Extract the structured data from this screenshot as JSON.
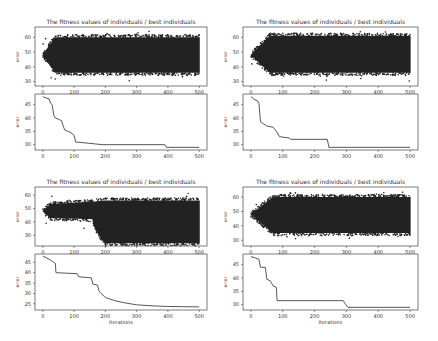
{
  "chart_data": [
    {
      "id": "top-left",
      "panel": {
        "x": 0,
        "y": 0
      },
      "scatter": {
        "type": "scatter",
        "title": "The fitness values of individuals / best individuals",
        "xlabel": "",
        "ylabel": "error",
        "xlim": [
          -25,
          525
        ],
        "ylim": [
          27,
          67
        ],
        "xticks": [
          0,
          100,
          200,
          300,
          400,
          500
        ],
        "yticks": [
          30,
          40,
          50,
          60
        ],
        "envelope": {
          "start": 48,
          "ramp_end": 40,
          "upper": 60,
          "lower": 36,
          "outlier_hi": 64,
          "outlier_lo": 30
        },
        "grid": false
      },
      "best": {
        "type": "line",
        "title": "",
        "xlabel": "Iterations",
        "ylabel": "error",
        "xlim": [
          -25,
          525
        ],
        "ylim": [
          28,
          49
        ],
        "xticks": [
          0,
          100,
          200,
          300,
          400,
          500
        ],
        "yticks": [
          30,
          35,
          40,
          45
        ],
        "x": [
          0,
          10,
          20,
          25,
          30,
          35,
          40,
          50,
          60,
          65,
          70,
          80,
          90,
          100,
          105,
          150,
          190,
          390,
          395,
          500
        ],
        "y": [
          48,
          47.5,
          47.2,
          45.5,
          45,
          41,
          40,
          39.5,
          39,
          37,
          35.5,
          35,
          34.5,
          33.5,
          31,
          30.5,
          30,
          30,
          29,
          29
        ],
        "grid": false
      }
    },
    {
      "id": "top-right",
      "panel": {
        "x": 219,
        "y": 0
      },
      "scatter": {
        "type": "scatter",
        "title": "The fitness values of individuals / best individuals",
        "xlabel": "",
        "ylabel": "error",
        "xlim": [
          -25,
          525
        ],
        "ylim": [
          27,
          67
        ],
        "xticks": [
          0,
          100,
          200,
          300,
          400,
          500
        ],
        "yticks": [
          30,
          40,
          50,
          60
        ],
        "envelope": {
          "start": 48,
          "ramp_end": 60,
          "upper": 61,
          "lower": 36,
          "outlier_hi": 64,
          "outlier_lo": 30
        },
        "grid": false
      },
      "best": {
        "type": "line",
        "title": "",
        "xlabel": "Iterations",
        "ylabel": "error",
        "xlim": [
          -25,
          525
        ],
        "ylim": [
          28,
          49
        ],
        "xticks": [
          0,
          100,
          200,
          300,
          400,
          500
        ],
        "yticks": [
          30,
          35,
          40,
          45
        ],
        "x": [
          0,
          10,
          20,
          25,
          30,
          50,
          70,
          80,
          90,
          120,
          125,
          240,
          245,
          500
        ],
        "y": [
          48,
          47,
          46.5,
          45.5,
          38.5,
          37,
          36.5,
          35,
          33,
          32.5,
          32,
          32,
          29,
          29
        ],
        "grid": false
      }
    },
    {
      "id": "bottom-left",
      "panel": {
        "x": 0,
        "y": 160
      },
      "scatter": {
        "type": "scatter",
        "title": "The fitness values of individuals / best individuals",
        "xlabel": "",
        "ylabel": "error",
        "xlim": [
          -25,
          525
        ],
        "ylim": [
          22,
          66
        ],
        "xticks": [
          0,
          100,
          200,
          300,
          400,
          500
        ],
        "yticks": [
          30,
          40,
          50,
          60
        ],
        "envelope": {
          "start": 48,
          "ramp_end": 0,
          "upper": 56,
          "lower": 24,
          "early_upper": 53,
          "early_lower": 43,
          "transition": [
            160,
            200
          ],
          "outlier_hi": 62,
          "outlier_lo": 34
        },
        "grid": false
      },
      "best": {
        "type": "line",
        "title": "",
        "xlabel": "Iterations",
        "ylabel": "error",
        "xlim": [
          -25,
          525
        ],
        "ylim": [
          22,
          49
        ],
        "xticks": [
          0,
          100,
          200,
          300,
          400,
          500
        ],
        "yticks": [
          25,
          30,
          35,
          40,
          45
        ],
        "x": [
          0,
          20,
          30,
          40,
          42,
          110,
          115,
          155,
          160,
          175,
          180,
          200,
          230,
          260,
          300,
          350,
          400,
          450,
          500
        ],
        "y": [
          48,
          46.5,
          45.5,
          44.5,
          40,
          39.5,
          38,
          37.5,
          34.5,
          34,
          31,
          28,
          26.5,
          25.5,
          24.5,
          24,
          23.7,
          23.6,
          23.5
        ],
        "grid": false
      }
    },
    {
      "id": "bottom-right",
      "panel": {
        "x": 219,
        "y": 160
      },
      "scatter": {
        "type": "scatter",
        "title": "The fitness values of individuals / best individuals",
        "xlabel": "",
        "ylabel": "error",
        "xlim": [
          -25,
          525
        ],
        "ylim": [
          26,
          67
        ],
        "xticks": [
          0,
          100,
          200,
          300,
          400,
          500
        ],
        "yticks": [
          30,
          40,
          50,
          60
        ],
        "envelope": {
          "start": 48,
          "ramp_end": 70,
          "upper": 60,
          "lower": 35,
          "outlier_hi": 64,
          "outlier_lo": 30
        },
        "grid": false
      },
      "best": {
        "type": "line",
        "title": "",
        "xlabel": "Iterations",
        "ylabel": "error",
        "xlim": [
          -25,
          525
        ],
        "ylim": [
          28,
          49
        ],
        "xticks": [
          0,
          100,
          200,
          300,
          400,
          500
        ],
        "yticks": [
          30,
          35,
          40,
          45
        ],
        "x": [
          0,
          15,
          25,
          30,
          45,
          50,
          60,
          65,
          70,
          80,
          82,
          290,
          295,
          305,
          500
        ],
        "y": [
          48,
          47.5,
          47,
          44,
          44,
          39.5,
          39,
          38,
          37,
          36.5,
          31.5,
          31.5,
          30.5,
          29,
          29
        ],
        "grid": false
      }
    }
  ]
}
